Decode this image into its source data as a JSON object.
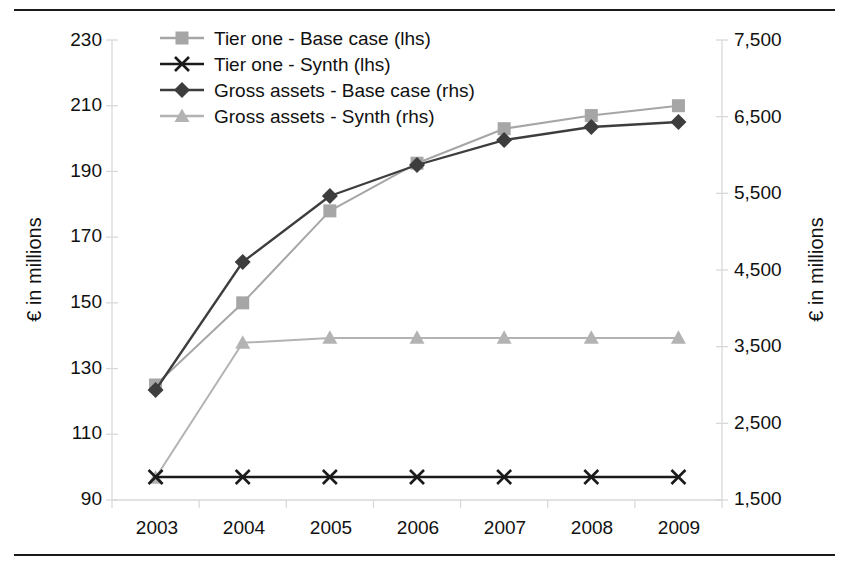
{
  "chart_data": {
    "type": "line",
    "title": "",
    "xlabel": "",
    "ylabel": "€ in millions",
    "y2label": "€ in millions",
    "categories": [
      "2003",
      "2004",
      "2005",
      "2006",
      "2007",
      "2008",
      "2009"
    ],
    "x": [
      2003,
      2004,
      2005,
      2006,
      2007,
      2008,
      2009
    ],
    "ylim": [
      90,
      230
    ],
    "y2lim": [
      1500,
      7500
    ],
    "yticks": [
      230,
      210,
      190,
      170,
      150,
      130,
      110,
      90
    ],
    "y2ticks": [
      "7,500",
      "6,500",
      "5,500",
      "4,500",
      "3,500",
      "2,500",
      "1,500"
    ],
    "y2ticks_values": [
      7500,
      6500,
      5500,
      4500,
      3500,
      2500,
      1500
    ],
    "grid": false,
    "legend_position": "top-left",
    "series": [
      {
        "name": "Tier one - Base case (lhs)",
        "axis": "left",
        "marker": "square",
        "color": "#a6a6a6",
        "values": [
          125,
          150,
          178,
          192.5,
          203,
          207,
          210
        ]
      },
      {
        "name": "Tier one - Synth (lhs)",
        "axis": "left",
        "marker": "x",
        "color": "#1a1a1a",
        "values": [
          97,
          97,
          97,
          97,
          97,
          97,
          97
        ]
      },
      {
        "name": "Gross assets - Base case (rhs)",
        "axis": "right",
        "marker": "diamond",
        "color": "#3d3d3d",
        "values": [
          2935,
          4605,
          5465,
          5870,
          6195,
          6365,
          6430
        ]
      },
      {
        "name": "Gross assets - Synth (rhs)",
        "axis": "right",
        "marker": "triangle",
        "color": "#b3b3b3",
        "values": [
          1790,
          3550,
          3615,
          3615,
          3615,
          3615,
          3615
        ]
      }
    ]
  },
  "colors": {
    "axis": "#d9d9d9",
    "rule": "#1a1a1a",
    "text": "#111111",
    "base_case_tier_one": "#a6a6a6",
    "synth_tier_one": "#1a1a1a",
    "base_case_gross": "#3d3d3d",
    "synth_gross": "#b3b3b3"
  }
}
